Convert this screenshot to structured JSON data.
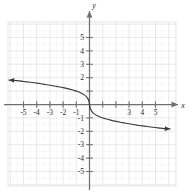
{
  "chart_data": {
    "type": "line",
    "title": "",
    "subtitle": "",
    "xlabel": "x",
    "ylabel": "y",
    "xlim": [
      -6.3,
      6.3
    ],
    "ylim": [
      -6.3,
      6.3
    ],
    "grid": true,
    "grid_color": "#e2e2e6",
    "minor_grid": true,
    "minor_grid_color": "#f0f0f2",
    "axis_color": "#6f6f72",
    "curve_color": "#3a3a3c",
    "legend": null,
    "x_tick_labels": [
      "-5",
      "-4",
      "-3",
      "-2",
      "-1",
      "3",
      "4",
      "5"
    ],
    "x_tick_values": [
      -5,
      -4,
      -3,
      -2,
      -1,
      3,
      4,
      5
    ],
    "x_ticks_all": [
      -5,
      -4,
      -3,
      -2,
      -1,
      1,
      2,
      3,
      4,
      5
    ],
    "y_tick_labels": [
      "5",
      "4",
      "3",
      "2",
      "-1",
      "-2",
      "-3",
      "-4",
      "-5"
    ],
    "y_tick_values": [
      5,
      4,
      3,
      2,
      -1,
      -2,
      -3,
      -4,
      -5
    ],
    "y_ticks_all": [
      -5,
      -4,
      -3,
      -2,
      -1,
      1,
      2,
      3,
      4,
      5
    ],
    "arrows": [
      "x-positive",
      "y-positive",
      "curve-left",
      "curve-right"
    ],
    "series": [
      {
        "name": "curve",
        "description": "decreasing odd function, steep near origin",
        "points": [
          [
            -6.1,
            1.82
          ],
          [
            -5.5,
            1.78
          ],
          [
            -5.0,
            1.72
          ],
          [
            -4.5,
            1.66
          ],
          [
            -4.0,
            1.6
          ],
          [
            -3.5,
            1.52
          ],
          [
            -3.0,
            1.44
          ],
          [
            -2.5,
            1.35
          ],
          [
            -2.0,
            1.26
          ],
          [
            -1.6,
            1.17
          ],
          [
            -1.2,
            1.06
          ],
          [
            -0.9,
            0.97
          ],
          [
            -0.6,
            0.84
          ],
          [
            -0.4,
            0.72
          ],
          [
            -0.25,
            0.6
          ],
          [
            -0.14,
            0.46
          ],
          [
            -0.07,
            0.32
          ],
          [
            -0.03,
            0.18
          ],
          [
            0.0,
            0.0
          ],
          [
            0.03,
            -0.18
          ],
          [
            0.07,
            -0.32
          ],
          [
            0.14,
            -0.46
          ],
          [
            0.25,
            -0.6
          ],
          [
            0.4,
            -0.72
          ],
          [
            0.6,
            -0.84
          ],
          [
            0.9,
            -0.97
          ],
          [
            1.2,
            -1.06
          ],
          [
            1.6,
            -1.17
          ],
          [
            2.0,
            -1.26
          ],
          [
            2.5,
            -1.35
          ],
          [
            3.0,
            -1.44
          ],
          [
            3.5,
            -1.52
          ],
          [
            4.0,
            -1.6
          ],
          [
            4.5,
            -1.66
          ],
          [
            5.0,
            -1.72
          ],
          [
            5.5,
            -1.78
          ],
          [
            6.1,
            -1.82
          ]
        ]
      }
    ]
  },
  "figure": {
    "alt": "Coordinate plane graph of a decreasing curve through the origin"
  }
}
